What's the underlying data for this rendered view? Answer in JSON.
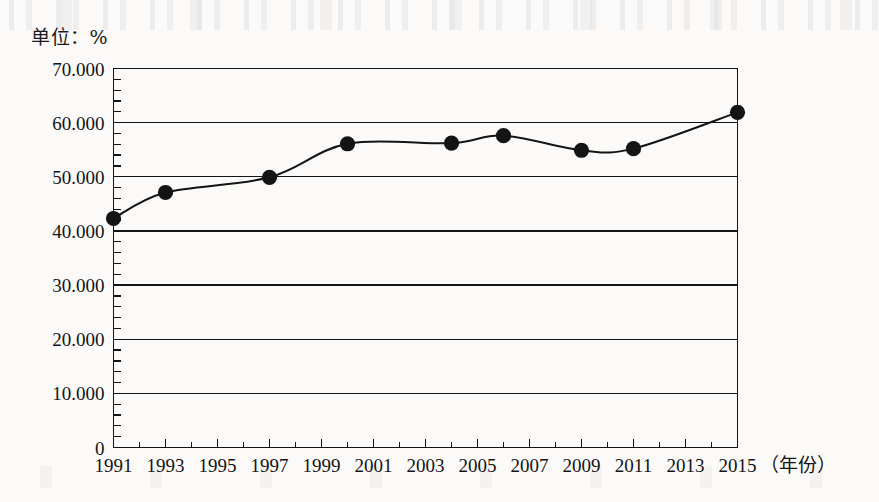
{
  "page": {
    "unit_label": "单位：%",
    "background_color": "#fbfaf8",
    "ink_color": "#141414"
  },
  "chart_data": {
    "type": "line",
    "title": "",
    "subtitle": "",
    "unit_note": "单位：%",
    "xlabel": "（年份）",
    "ylabel": "",
    "x": [
      1991,
      1993,
      1997,
      2000,
      2004,
      2006,
      2009,
      2011,
      2015
    ],
    "values": [
      42.3,
      47.1,
      49.9,
      56.1,
      56.2,
      57.6,
      54.9,
      55.2,
      61.9
    ],
    "series": [
      {
        "name": "比重",
        "x": [
          1991,
          1993,
          1997,
          2000,
          2004,
          2006,
          2009,
          2011,
          2015
        ],
        "values": [
          42.3,
          47.1,
          49.9,
          56.1,
          56.2,
          57.6,
          54.9,
          55.2,
          61.9
        ]
      }
    ],
    "xlim": [
      1991,
      2015
    ],
    "ylim": [
      0,
      70
    ],
    "ytick_labels": [
      "0",
      "10.000",
      "20.000",
      "30.000",
      "40.000",
      "50.000",
      "60.000",
      "70.000"
    ],
    "ytick_values": [
      0,
      10,
      20,
      30,
      40,
      50,
      60,
      70
    ],
    "ytick_minor_step": 2,
    "xtick_labels": [
      "1991",
      "1993",
      "1995",
      "1997",
      "1999",
      "2001",
      "2003",
      "2005",
      "2007",
      "2009",
      "2011",
      "2013",
      "2015"
    ],
    "xtick_values": [
      1991,
      1993,
      1995,
      1997,
      1999,
      2001,
      2003,
      2005,
      2007,
      2009,
      2011,
      2013,
      2015
    ],
    "xtick_minor_step": 1,
    "grid": "horizontal",
    "legend": "none",
    "marker": "filled-circle",
    "line_color": "#141414",
    "marker_color": "#141414",
    "plot_box": "left-top-right-bottom-border"
  }
}
